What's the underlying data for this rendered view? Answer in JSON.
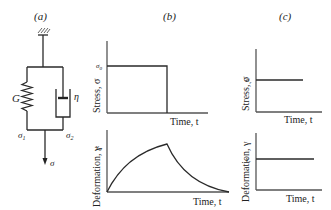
{
  "panels": {
    "a": {
      "label": "(a)",
      "spring_label": "G",
      "dashpot_label": "η",
      "stress_left": "σ",
      "stress_left_sub": "1",
      "stress_right": "σ",
      "stress_right_sub": "2",
      "force_label": "σ"
    },
    "b": {
      "label": "(b)",
      "stress_plot": {
        "ylabel": "Stress, σ",
        "xlabel": "Time, t",
        "level_label": "σ",
        "level_sub": "0"
      },
      "deformation_plot": {
        "ylabel": "Deformation, γ",
        "xlabel": "Time, t",
        "level_label": "γ",
        "level_sub": "0"
      }
    },
    "c": {
      "label": "(c)",
      "stress_plot": {
        "ylabel": "Stress, σ",
        "xlabel": "Time, t",
        "level_label": "σ",
        "level_sub": "r"
      },
      "deformation_plot": {
        "ylabel": "Deformation, γ",
        "xlabel": "Time, t",
        "level_label": "γ",
        "level_sub": "r"
      }
    }
  }
}
